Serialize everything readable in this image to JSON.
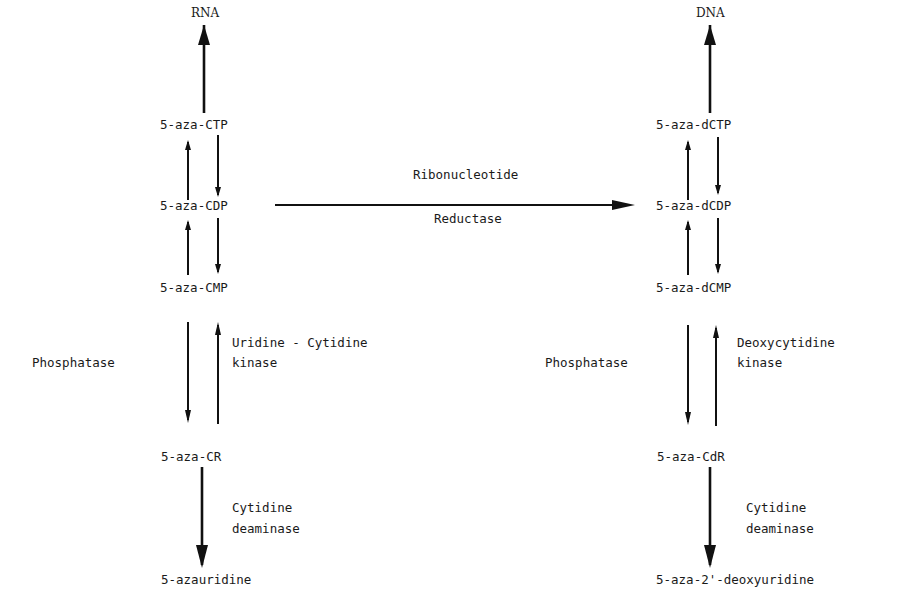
{
  "diagram": {
    "left_pathway": {
      "top_product": "RNA",
      "nodes": [
        "5-aza-CTP",
        "5-aza-CDP",
        "5-aza-CMP",
        "5-aza-CR",
        "5-azauridine"
      ],
      "enzymes": {
        "dephosphorylation": "Phosphatase",
        "phosphorylation_line1": "Uridine - Cytidine",
        "phosphorylation_line2": "kinase",
        "deamination_line1": "Cytidine",
        "deamination_line2": "deaminase"
      }
    },
    "right_pathway": {
      "top_product": "DNA",
      "nodes": [
        "5-aza-dCTP",
        "5-aza-dCDP",
        "5-aza-dCMP",
        "5-aza-CdR",
        "5-aza-2'-deoxyuridine"
      ],
      "enzymes": {
        "dephosphorylation": "Phosphatase",
        "phosphorylation_line1": "Deoxycytidine",
        "phosphorylation_line2": "kinase",
        "deamination_line1": "Cytidine",
        "deamination_line2": "deaminase"
      }
    },
    "connector": {
      "from": "5-aza-CDP",
      "to": "5-aza-dCDP",
      "label_above": "Ribonucleotide",
      "label_below": "Reductase"
    }
  }
}
